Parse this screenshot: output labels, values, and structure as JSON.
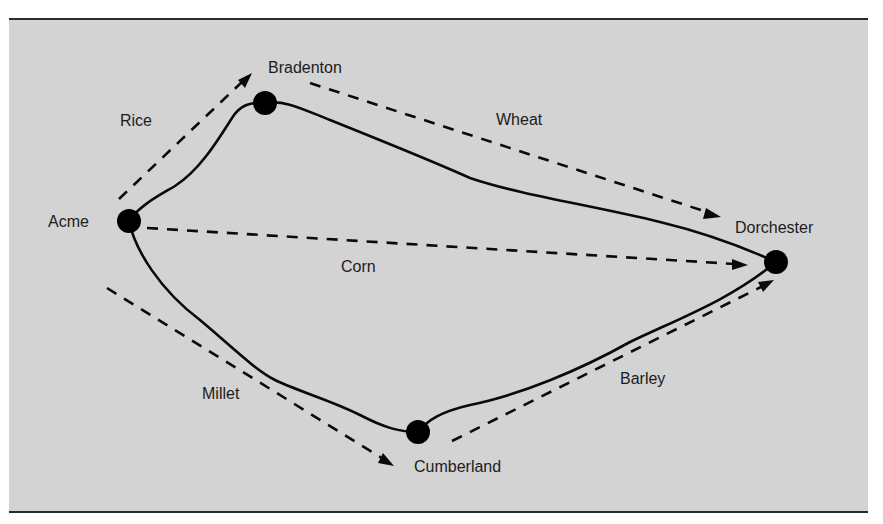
{
  "diagram": {
    "background_color": "#d3d3d3",
    "line_color": "#0a0a0a",
    "nodes": [
      {
        "id": "acme",
        "label": "Acme",
        "x": 129,
        "y": 221
      },
      {
        "id": "bradenton",
        "label": "Bradenton",
        "x": 265,
        "y": 103
      },
      {
        "id": "dorchester",
        "label": "Dorchester",
        "x": 776,
        "y": 262
      },
      {
        "id": "cumberland",
        "label": "Cumberland",
        "x": 418,
        "y": 432
      }
    ],
    "routes": [
      {
        "from": "Acme",
        "to": "Bradenton",
        "style": "solid"
      },
      {
        "from": "Bradenton",
        "to": "Dorchester",
        "style": "solid"
      },
      {
        "from": "Acme",
        "to": "Cumberland",
        "style": "solid"
      },
      {
        "from": "Cumberland",
        "to": "Dorchester",
        "style": "solid"
      }
    ],
    "flows": [
      {
        "commodity": "Rice",
        "from": "Acme",
        "to": "Bradenton",
        "style": "dashed-arrow"
      },
      {
        "commodity": "Wheat",
        "from": "Bradenton",
        "to": "Dorchester",
        "style": "dashed-arrow"
      },
      {
        "commodity": "Corn",
        "from": "Acme",
        "to": "Dorchester",
        "style": "dashed-arrow"
      },
      {
        "commodity": "Millet",
        "from": "Acme",
        "to": "Cumberland",
        "style": "dashed-arrow"
      },
      {
        "commodity": "Barley",
        "from": "Cumberland",
        "to": "Dorchester",
        "style": "dashed-arrow"
      }
    ]
  }
}
